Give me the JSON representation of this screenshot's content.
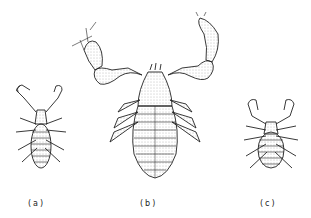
{
  "figure": {
    "panels": [
      {
        "id": "a",
        "label": "(a)",
        "subject": "small pseudoscorpion, dorsal view"
      },
      {
        "id": "b",
        "label": "(b)",
        "subject": "large pseudoscorpion, dorsal view with extended pedipalps"
      },
      {
        "id": "c",
        "label": "(c)",
        "subject": "small round-bodied pseudoscorpion, dorsal view"
      }
    ],
    "colors": {
      "ink": "#222222",
      "background": "#ffffff",
      "stipple": "#888888"
    }
  }
}
